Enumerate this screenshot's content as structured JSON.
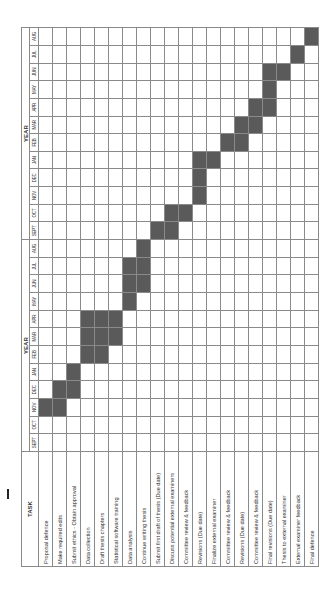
{
  "chart_data": {
    "type": "table",
    "task_header": "TASK",
    "year_headers": [
      "YEAR",
      "YEAR"
    ],
    "months": [
      "SEPT",
      "OCT",
      "NOV",
      "DEC",
      "JAN",
      "FEB",
      "MAR",
      "APR",
      "MAY",
      "JUN",
      "JUL",
      "AUG",
      "SEPT",
      "OCT",
      "NOV",
      "DEC",
      "JAN",
      "FEB",
      "MAR",
      "APR",
      "MAY",
      "JUN",
      "JUL",
      "AUG"
    ],
    "tasks": [
      {
        "name": "Proposal defence",
        "months": [
          2
        ]
      },
      {
        "name": "Make required edits",
        "months": [
          2,
          3
        ]
      },
      {
        "name": "Submit ethics - Obtain approval",
        "months": [
          3,
          4
        ]
      },
      {
        "name": "Data collection",
        "months": [
          5,
          6,
          7
        ]
      },
      {
        "name": "Draft thesis chapters",
        "months": [
          5,
          6,
          7
        ]
      },
      {
        "name": "Statistical software training",
        "months": [
          6,
          7
        ]
      },
      {
        "name": "Data analysis",
        "months": [
          8,
          9,
          10
        ]
      },
      {
        "name": "Continue writing thesis",
        "months": [
          9,
          10,
          11
        ]
      },
      {
        "name": "Submit first draft of thesis (Due date)",
        "months": [
          12
        ]
      },
      {
        "name": "Discuss potential external examiners",
        "months": [
          12,
          13
        ]
      },
      {
        "name": "Committee review & feedback",
        "months": [
          13
        ]
      },
      {
        "name": "Revisions (Due date)",
        "months": [
          14,
          15,
          16
        ]
      },
      {
        "name": "Finalize external examiner",
        "months": [
          16
        ]
      },
      {
        "name": "Committee review & feedback",
        "months": [
          17
        ]
      },
      {
        "name": "Revisions (Due date)",
        "months": [
          17,
          18
        ]
      },
      {
        "name": "Committee review & feedback",
        "months": [
          18,
          19
        ]
      },
      {
        "name": "Final revisions (Due date)",
        "months": [
          19,
          20,
          21
        ]
      },
      {
        "name": "Thesis to external examiner",
        "months": [
          21
        ]
      },
      {
        "name": "External examiner feedback",
        "months": [
          22
        ]
      },
      {
        "name": "Final defence",
        "months": [
          23
        ]
      }
    ],
    "fill_color": "#5a5a5a",
    "grid": true
  },
  "marker": "1"
}
